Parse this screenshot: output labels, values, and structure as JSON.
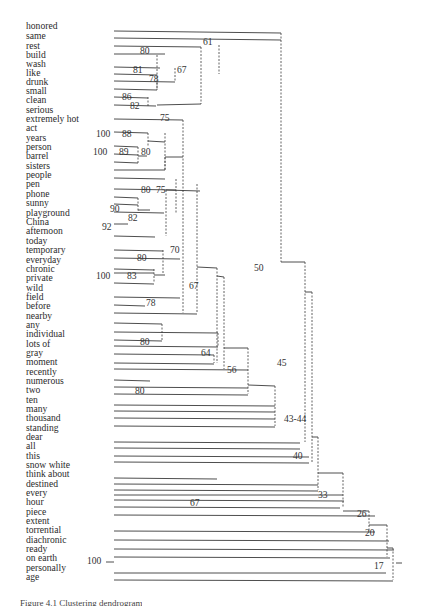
{
  "figure": {
    "type": "dendrogram",
    "caption": "Figure 4.1 Clustering dendrogram",
    "line_color": "#3a3a3a",
    "leaf_label_x": 26
  },
  "leaves": [
    {
      "label": "honored",
      "y": 26
    },
    {
      "label": "same",
      "y": 36
    },
    {
      "label": "rest",
      "y": 46
    },
    {
      "label": "build",
      "y": 55
    },
    {
      "label": "wash",
      "y": 64
    },
    {
      "label": "like",
      "y": 73
    },
    {
      "label": "drunk",
      "y": 82
    },
    {
      "label": "small",
      "y": 91
    },
    {
      "label": "clean",
      "y": 100
    },
    {
      "label": "serious",
      "y": 110
    },
    {
      "label": "extremely hot",
      "y": 119
    },
    {
      "label": "act",
      "y": 128
    },
    {
      "label": "years",
      "y": 138
    },
    {
      "label": "person",
      "y": 147
    },
    {
      "label": "barrel",
      "y": 156
    },
    {
      "label": "sisters",
      "y": 166
    },
    {
      "label": "people",
      "y": 175
    },
    {
      "label": "pen",
      "y": 184
    },
    {
      "label": "phone",
      "y": 194
    },
    {
      "label": "sunny",
      "y": 203
    },
    {
      "label": "playground",
      "y": 213
    },
    {
      "label": "China",
      "y": 222
    },
    {
      "label": "afternoon",
      "y": 231
    },
    {
      "label": "today",
      "y": 241
    },
    {
      "label": "temporary",
      "y": 250
    },
    {
      "label": "everyday",
      "y": 260
    },
    {
      "label": "chronic",
      "y": 269
    },
    {
      "label": "private",
      "y": 278
    },
    {
      "label": "wild",
      "y": 288
    },
    {
      "label": "field",
      "y": 297
    },
    {
      "label": "before",
      "y": 306
    },
    {
      "label": "nearby",
      "y": 316
    },
    {
      "label": "any",
      "y": 325
    },
    {
      "label": "individual",
      "y": 334
    },
    {
      "label": "lots of",
      "y": 344
    },
    {
      "label": "gray",
      "y": 353
    },
    {
      "label": "moment",
      "y": 362
    },
    {
      "label": "recently",
      "y": 372
    },
    {
      "label": "numerous",
      "y": 381
    },
    {
      "label": "two",
      "y": 390
    },
    {
      "label": "ten",
      "y": 400
    },
    {
      "label": "many",
      "y": 409
    },
    {
      "label": "thousand",
      "y": 418
    },
    {
      "label": "standing",
      "y": 428
    },
    {
      "label": "dear",
      "y": 437
    },
    {
      "label": "all",
      "y": 446
    },
    {
      "label": "this",
      "y": 456
    },
    {
      "label": "snow white",
      "y": 465
    },
    {
      "label": "think about",
      "y": 474
    },
    {
      "label": "destined",
      "y": 484
    },
    {
      "label": "every",
      "y": 493
    },
    {
      "label": "hour",
      "y": 502
    },
    {
      "label": "piece",
      "y": 512
    },
    {
      "label": "extent",
      "y": 521
    },
    {
      "label": "torrential",
      "y": 530
    },
    {
      "label": "diachronic",
      "y": 540
    },
    {
      "label": "ready",
      "y": 549
    },
    {
      "label": "on earth",
      "y": 558
    },
    {
      "label": "personally",
      "y": 568
    },
    {
      "label": "age",
      "y": 577
    }
  ],
  "node_labels": [
    {
      "text": "61",
      "x": 203,
      "y": 42
    },
    {
      "text": "80",
      "x": 140,
      "y": 51
    },
    {
      "text": "81",
      "x": 133,
      "y": 70
    },
    {
      "text": "67",
      "x": 177,
      "y": 70
    },
    {
      "text": "78",
      "x": 149,
      "y": 79
    },
    {
      "text": "86",
      "x": 122,
      "y": 97
    },
    {
      "text": "82",
      "x": 130,
      "y": 106
    },
    {
      "text": "75",
      "x": 160,
      "y": 118
    },
    {
      "text": "100",
      "x": 96,
      "y": 134
    },
    {
      "text": "88",
      "x": 122,
      "y": 134
    },
    {
      "text": "100",
      "x": 93,
      "y": 152
    },
    {
      "text": "89",
      "x": 119,
      "y": 152
    },
    {
      "text": "80",
      "x": 141,
      "y": 152
    },
    {
      "text": "80",
      "x": 141,
      "y": 190
    },
    {
      "text": "75",
      "x": 156,
      "y": 190
    },
    {
      "text": "90",
      "x": 110,
      "y": 209
    },
    {
      "text": "82",
      "x": 128,
      "y": 218
    },
    {
      "text": "92",
      "x": 102,
      "y": 227
    },
    {
      "text": "70",
      "x": 170,
      "y": 250
    },
    {
      "text": "80",
      "x": 137,
      "y": 258
    },
    {
      "text": "100",
      "x": 96,
      "y": 276
    },
    {
      "text": "83",
      "x": 127,
      "y": 276
    },
    {
      "text": "67",
      "x": 189,
      "y": 286
    },
    {
      "text": "78",
      "x": 146,
      "y": 303
    },
    {
      "text": "80",
      "x": 140,
      "y": 342
    },
    {
      "text": "64",
      "x": 201,
      "y": 353
    },
    {
      "text": "56",
      "x": 227,
      "y": 370
    },
    {
      "text": "80",
      "x": 135,
      "y": 391
    },
    {
      "text": "50",
      "x": 254,
      "y": 268
    },
    {
      "text": "45",
      "x": 277,
      "y": 363
    },
    {
      "text": "43-44",
      "x": 284,
      "y": 419
    },
    {
      "text": "40",
      "x": 293,
      "y": 456
    },
    {
      "text": "33",
      "x": 318,
      "y": 495
    },
    {
      "text": "67",
      "x": 190,
      "y": 503
    },
    {
      "text": "26",
      "x": 357,
      "y": 514
    },
    {
      "text": "20",
      "x": 365,
      "y": 533
    },
    {
      "text": "17",
      "x": 374,
      "y": 566
    },
    {
      "text": "100",
      "x": 87,
      "y": 561
    }
  ],
  "solid_lines": [
    [
      114,
      31,
      281,
      33
    ],
    [
      114,
      38,
      281,
      40
    ],
    [
      114,
      46,
      201,
      47
    ],
    [
      114,
      54,
      165,
      54
    ],
    [
      114,
      67,
      160,
      68
    ],
    [
      114,
      74,
      157,
      75
    ],
    [
      114,
      81,
      175,
      82
    ],
    [
      114,
      89,
      157,
      90
    ],
    [
      114,
      97,
      148,
      98
    ],
    [
      114,
      105,
      156,
      106
    ],
    [
      157,
      105,
      201,
      104
    ],
    [
      114,
      119,
      183,
      120
    ],
    [
      114,
      132,
      148,
      133
    ],
    [
      148,
      141,
      165,
      142
    ],
    [
      114,
      146,
      138,
      147
    ],
    [
      114,
      154,
      138,
      155
    ],
    [
      114,
      162,
      138,
      163
    ],
    [
      138,
      156,
      147,
      156
    ],
    [
      114,
      170,
      165,
      170
    ],
    [
      165,
      157,
      183,
      157
    ],
    [
      114,
      178,
      165,
      179
    ],
    [
      114,
      189,
      176,
      190
    ],
    [
      166,
      190,
      200,
      191
    ],
    [
      114,
      197,
      138,
      198
    ],
    [
      114,
      204,
      138,
      205
    ],
    [
      114,
      212,
      164,
      213
    ],
    [
      138,
      210,
      150,
      210
    ],
    [
      114,
      224,
      128,
      224
    ],
    [
      114,
      236,
      155,
      237
    ],
    [
      114,
      250,
      163,
      251
    ],
    [
      114,
      258,
      180,
      259
    ],
    [
      114,
      269,
      154,
      270
    ],
    [
      114,
      273,
      154,
      273
    ],
    [
      154,
      275,
      165,
      275
    ],
    [
      114,
      283,
      154,
      284
    ],
    [
      114,
      297,
      180,
      298
    ],
    [
      114,
      305,
      145,
      306
    ],
    [
      114,
      313,
      197,
      314
    ],
    [
      197,
      267,
      217,
      268
    ],
    [
      217,
      276,
      224,
      277
    ],
    [
      114,
      323,
      162,
      324
    ],
    [
      114,
      332,
      218,
      333
    ],
    [
      114,
      340,
      162,
      341
    ],
    [
      114,
      346,
      218,
      347
    ],
    [
      114,
      354,
      214,
      355
    ],
    [
      224,
      348,
      248,
      348
    ],
    [
      114,
      363,
      214,
      364
    ],
    [
      114,
      369,
      248,
      370
    ],
    [
      114,
      380,
      150,
      381
    ],
    [
      114,
      387,
      248,
      388
    ],
    [
      248,
      385,
      275,
      386
    ],
    [
      114,
      394,
      248,
      395
    ],
    [
      114,
      405,
      275,
      406
    ],
    [
      114,
      411,
      275,
      412
    ],
    [
      114,
      418,
      275,
      419
    ],
    [
      114,
      426,
      275,
      427
    ],
    [
      114,
      442,
      300,
      443
    ],
    [
      114,
      448,
      300,
      449
    ],
    [
      114,
      456,
      309,
      457
    ],
    [
      114,
      462,
      309,
      463
    ],
    [
      114,
      478,
      217,
      479
    ],
    [
      114,
      484,
      318,
      485
    ],
    [
      114,
      490,
      318,
      491
    ],
    [
      114,
      495,
      343,
      495
    ],
    [
      114,
      500,
      344,
      501
    ],
    [
      114,
      507,
      340,
      508
    ],
    [
      114,
      515,
      375,
      516
    ],
    [
      114,
      531,
      375,
      532
    ],
    [
      114,
      540,
      389,
      541
    ],
    [
      114,
      549,
      394,
      550
    ],
    [
      114,
      557,
      390,
      558
    ],
    [
      114,
      573,
      386,
      573
    ],
    [
      114,
      580,
      393,
      581
    ],
    [
      281,
      262,
      305,
      262
    ],
    [
      305,
      292,
      312,
      292
    ],
    [
      312,
      437,
      318,
      437
    ],
    [
      318,
      473,
      343,
      473
    ],
    [
      343,
      511,
      369,
      511
    ],
    [
      369,
      525,
      387,
      525
    ],
    [
      387,
      548,
      393,
      548
    ],
    [
      396,
      563,
      402,
      563
    ],
    [
      106,
      562,
      114,
      562
    ],
    [
      114,
      567,
      114,
      567
    ]
  ],
  "dashed_lines": [
    [
      201,
      47,
      201,
      104
    ],
    [
      157,
      55,
      157,
      90
    ],
    [
      175,
      68,
      175,
      82
    ],
    [
      157,
      82,
      157,
      90
    ],
    [
      148,
      97,
      148,
      106
    ],
    [
      281,
      33,
      281,
      262
    ],
    [
      219,
      45,
      219,
      74
    ],
    [
      183,
      120,
      183,
      313
    ],
    [
      165,
      133,
      165,
      170
    ],
    [
      148,
      133,
      148,
      147
    ],
    [
      138,
      147,
      138,
      163
    ],
    [
      165,
      157,
      165,
      170
    ],
    [
      176,
      179,
      176,
      213
    ],
    [
      166,
      190,
      166,
      236
    ],
    [
      138,
      198,
      138,
      212
    ],
    [
      163,
      250,
      163,
      274
    ],
    [
      154,
      269,
      154,
      283
    ],
    [
      197,
      184,
      197,
      313
    ],
    [
      162,
      324,
      162,
      340
    ],
    [
      217,
      268,
      217,
      363
    ],
    [
      224,
      277,
      224,
      369
    ],
    [
      248,
      348,
      248,
      394
    ],
    [
      275,
      386,
      275,
      426
    ],
    [
      305,
      262,
      305,
      442
    ],
    [
      312,
      292,
      312,
      462
    ],
    [
      318,
      437,
      318,
      490
    ],
    [
      343,
      473,
      343,
      507
    ],
    [
      369,
      511,
      369,
      531
    ],
    [
      387,
      525,
      387,
      557
    ],
    [
      393,
      548,
      393,
      580
    ],
    [
      218,
      333,
      218,
      347
    ],
    [
      214,
      355,
      214,
      363
    ]
  ]
}
